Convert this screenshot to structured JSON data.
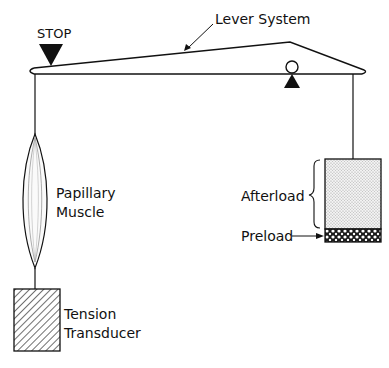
{
  "diagram": {
    "labels": {
      "stop": "STOP",
      "lever": "Lever System",
      "muscle_line1": "Papillary",
      "muscle_line2": "Muscle",
      "transducer_line1": "Tension",
      "transducer_line2": "Transducer",
      "afterload": "Afterload",
      "preload": "Preload"
    },
    "components": [
      {
        "id": "stop",
        "shape": "filled-triangle-down",
        "label": "STOP"
      },
      {
        "id": "lever",
        "shape": "lever-beam",
        "label": "Lever System"
      },
      {
        "id": "fulcrum",
        "shape": "circle-on-triangle"
      },
      {
        "id": "papillary-muscle",
        "shape": "spindle",
        "label": "Papillary Muscle"
      },
      {
        "id": "tension-transducer",
        "shape": "hatched-rectangle",
        "label": "Tension Transducer"
      },
      {
        "id": "afterload-weight",
        "shape": "stippled-rectangle",
        "label": "Afterload"
      },
      {
        "id": "preload-weight",
        "shape": "crosshatched-rectangle",
        "label": "Preload"
      }
    ],
    "colors": {
      "stroke": "#111111",
      "background": "#ffffff",
      "stipple": "#bdbdbd"
    }
  }
}
